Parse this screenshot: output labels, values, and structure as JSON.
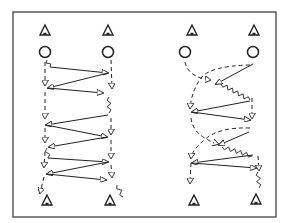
{
  "figure": {
    "top_caption_fragment": "",
    "frame": {
      "x": 13,
      "y": 12,
      "width": 263,
      "height": 205
    },
    "colors": {
      "ink": "#222222",
      "background": "#ffffff"
    },
    "legend_semantics": {
      "cone": "triangle marker",
      "player": "circle",
      "solid_line": "pass",
      "dashed_line": "player run",
      "wavy_line": "dribble"
    }
  },
  "panels": [
    {
      "name": "left-drill",
      "top_cones": [
        [
          45,
          30
        ],
        [
          108,
          30
        ]
      ],
      "players": [
        [
          45,
          52
        ],
        [
          108,
          52
        ]
      ],
      "bottom_cones": [
        [
          47,
          200
        ],
        [
          110,
          200
        ]
      ],
      "passes": [
        [
          [
            50,
            67
          ],
          [
            108,
            73
          ]
        ],
        [
          [
            108,
            73
          ],
          [
            48,
            88
          ]
        ],
        [
          [
            48,
            88
          ],
          [
            103,
            93
          ]
        ],
        [
          [
            108,
            115
          ],
          [
            46,
            125
          ]
        ],
        [
          [
            46,
            125
          ],
          [
            107,
            137
          ]
        ],
        [
          [
            107,
            137
          ],
          [
            49,
            147
          ]
        ],
        [
          [
            48,
            158
          ],
          [
            108,
            162
          ]
        ],
        [
          [
            108,
            162
          ],
          [
            47,
            174
          ]
        ],
        [
          [
            47,
            174
          ],
          [
            106,
            180
          ]
        ]
      ],
      "runs": [
        [
          [
            45,
            62
          ],
          [
            45,
            85
          ]
        ],
        [
          [
            45,
            92
          ],
          [
            45,
            118
          ]
        ],
        [
          [
            45,
            128
          ],
          [
            45,
            142
          ]
        ],
        [
          [
            45,
            152
          ],
          [
            44,
            167
          ]
        ],
        [
          [
            44,
            177
          ],
          [
            40,
            193
          ]
        ],
        [
          [
            111,
            60
          ],
          [
            112,
            88
          ]
        ],
        [
          [
            111,
            118
          ],
          [
            111,
            134
          ]
        ],
        [
          [
            111,
            140
          ],
          [
            111,
            158
          ]
        ],
        [
          [
            111,
            165
          ],
          [
            112,
            177
          ]
        ]
      ],
      "dribbles": [
        [
          [
            47,
            60
          ],
          [
            50,
            67
          ]
        ],
        [
          [
            109,
            97
          ],
          [
            109,
            113
          ]
        ],
        [
          [
            47,
            148
          ],
          [
            48,
            158
          ]
        ],
        [
          [
            117,
            185
          ],
          [
            123,
            197
          ]
        ]
      ]
    },
    {
      "name": "right-drill",
      "top_cones": [
        [
          192,
          30
        ],
        [
          254,
          30
        ]
      ],
      "players": [
        [
          185,
          52
        ],
        [
          253,
          52
        ]
      ],
      "bottom_cones": [
        [
          194,
          200
        ],
        [
          256,
          199
        ]
      ],
      "passes": [
        [
          [
            253,
            64
          ],
          [
            216,
            84
          ]
        ],
        [
          [
            250,
            101
          ],
          [
            192,
            112
          ]
        ],
        [
          [
            192,
            112
          ],
          [
            250,
            120
          ]
        ],
        [
          [
            249,
            132
          ],
          [
            219,
            145
          ]
        ],
        [
          [
            253,
            155
          ],
          [
            192,
            163
          ]
        ],
        [
          [
            192,
            163
          ],
          [
            256,
            168
          ]
        ]
      ],
      "runs": [
        [
          [
            185,
            62
          ],
          [
            188,
            77
          ],
          [
            210,
            80
          ]
        ],
        [
          [
            250,
            65
          ],
          [
            210,
            66
          ],
          [
            192,
            90
          ],
          [
            190,
            108
          ]
        ],
        [
          [
            252,
            98
          ],
          [
            252,
            118
          ]
        ],
        [
          [
            191,
            118
          ],
          [
            193,
            136
          ],
          [
            218,
            144
          ]
        ],
        [
          [
            250,
            128
          ],
          [
            220,
            127
          ],
          [
            192,
            150
          ],
          [
            191,
            158
          ]
        ],
        [
          [
            191,
            163
          ],
          [
            190,
            183
          ]
        ],
        [
          [
            258,
            156
          ],
          [
            259,
            170
          ]
        ]
      ],
      "dribbles": [
        [
          [
            221,
            84
          ],
          [
            250,
            100
          ]
        ],
        [
          [
            222,
            147
          ],
          [
            252,
            156
          ]
        ],
        [
          [
            258,
            172
          ],
          [
            259,
            188
          ]
        ]
      ]
    }
  ]
}
